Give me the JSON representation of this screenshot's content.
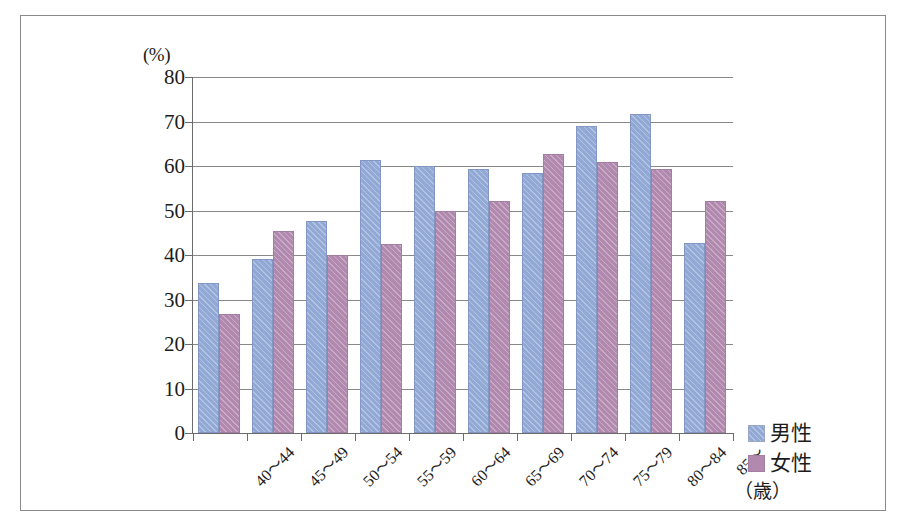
{
  "chart_data": {
    "type": "bar",
    "title": "",
    "xlabel": "(歳)",
    "ylabel": "(%)",
    "ylim": [
      0,
      80
    ],
    "ytick_step": 10,
    "yticks": [
      "80",
      "70",
      "60",
      "50",
      "40",
      "30",
      "20",
      "10",
      "0"
    ],
    "ytick_values": [
      80,
      70,
      60,
      50,
      40,
      30,
      20,
      10,
      0
    ],
    "grid": true,
    "legend_position": "right",
    "categories": [
      "40～44",
      "45～49",
      "50～54",
      "55～59",
      "60～64",
      "65～69",
      "70～74",
      "75～79",
      "80～84",
      "85～"
    ],
    "series": [
      {
        "name": "男性",
        "color": "#92a9d6",
        "values": [
          33.7,
          39.2,
          47.6,
          61.3,
          59.9,
          59.3,
          58.4,
          69.1,
          71.8,
          42.6
        ]
      },
      {
        "name": "女性",
        "color": "#b189ae",
        "values": [
          26.7,
          45.4,
          40.1,
          42.4,
          50.0,
          52.2,
          62.8,
          61.0,
          59.3,
          52.1
        ]
      }
    ]
  },
  "legend": {
    "items": [
      {
        "label": "男性",
        "color": "#92a9d6"
      },
      {
        "label": "女性",
        "color": "#b189ae"
      }
    ]
  },
  "axes": {
    "y_unit": "(%)",
    "x_unit": "（歳）"
  }
}
